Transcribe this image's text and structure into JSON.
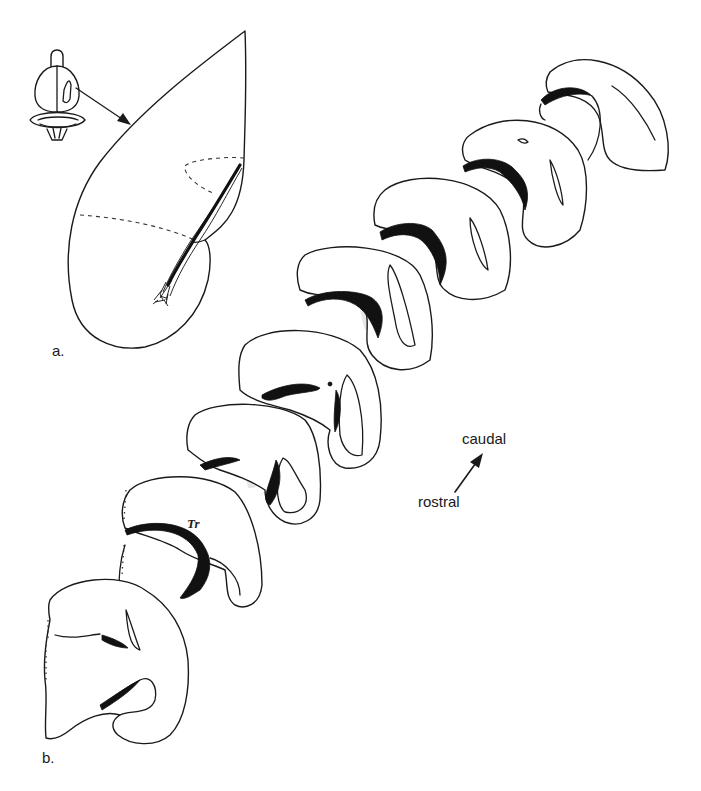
{
  "figure": {
    "panels": [
      {
        "id": "a",
        "label": "a.",
        "description": "Dorsal view of brain inset with arrow to enlarged hemisphere showing labeled fiber tract"
      },
      {
        "id": "b",
        "label": "b.",
        "description": "Series of eight coronal sections arranged rostral (bottom-left) to caudal (top-right) with black tract and shaded region"
      }
    ],
    "annotations": {
      "tract_region_label": "Tr",
      "orientation": {
        "caudal_label": "caudal",
        "rostral_label": "rostral"
      }
    },
    "section_count": 8,
    "colors": {
      "line": "#1a1a1a",
      "tract_fill": "#111111",
      "shaded_region": "#e6e6e6",
      "background": "#ffffff"
    }
  }
}
